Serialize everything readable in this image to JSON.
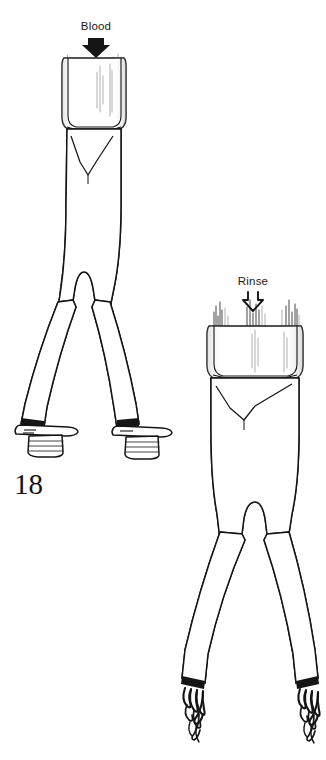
{
  "figure": {
    "number": "18",
    "background_color": "#ffffff",
    "ink_color": "#151515",
    "width": 326,
    "height": 760
  },
  "annotations": {
    "blood": {
      "label": "Blood",
      "arrow_style": "solid-down-arrow",
      "arrow_icon_name": "arrow-down-solid-icon",
      "x": 96,
      "y": 26
    },
    "rinse": {
      "label": "Rinse",
      "arrow_style": "hollow-down-arrow",
      "arrow_icon_name": "arrow-down-outline-icon",
      "x": 253,
      "y": 281
    }
  },
  "grafts": [
    {
      "id": "blood-graft",
      "name": "left-bifurcated-graft",
      "label_ref": "Blood",
      "texture": "corrugated-shaded",
      "cuff": "clear-proximal-cuff",
      "limb_termination": "flanged-clamp-connector",
      "limb_count": 2
    },
    {
      "id": "rinse-graft",
      "name": "right-bifurcated-graft",
      "label_ref": "Rinse",
      "texture": "corrugated-ringed",
      "cuff": "clear-proximal-cuff",
      "limb_termination": "frayed-sutured-end",
      "limb_count": 2
    }
  ]
}
